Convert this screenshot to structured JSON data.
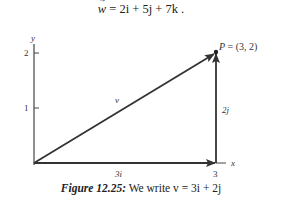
{
  "equation": {
    "lhs": "w",
    "text": "= 2i + 5j + 7k ."
  },
  "figure": {
    "axes": {
      "x_label": "x",
      "y_label": "y",
      "x_ticks": [
        {
          "value": 3,
          "label": "3"
        }
      ],
      "y_ticks": [
        {
          "value": 1,
          "label": "1"
        },
        {
          "value": 2,
          "label": "2"
        }
      ]
    },
    "point": {
      "name": "P",
      "label": "P = (3, 2)",
      "x": 3,
      "y": 2
    },
    "vectors": [
      {
        "name": "v",
        "label": "v",
        "from": [
          0,
          0
        ],
        "to": [
          3,
          2
        ]
      },
      {
        "name": "3i",
        "label": "3i",
        "from": [
          0,
          0
        ],
        "to": [
          3,
          0
        ]
      },
      {
        "name": "2j",
        "label": "2j",
        "from": [
          3,
          0
        ],
        "to": [
          3,
          2
        ]
      }
    ]
  },
  "caption": {
    "figure_label": "Figure 12.25:",
    "text": "We write v = 3i + 2j"
  }
}
